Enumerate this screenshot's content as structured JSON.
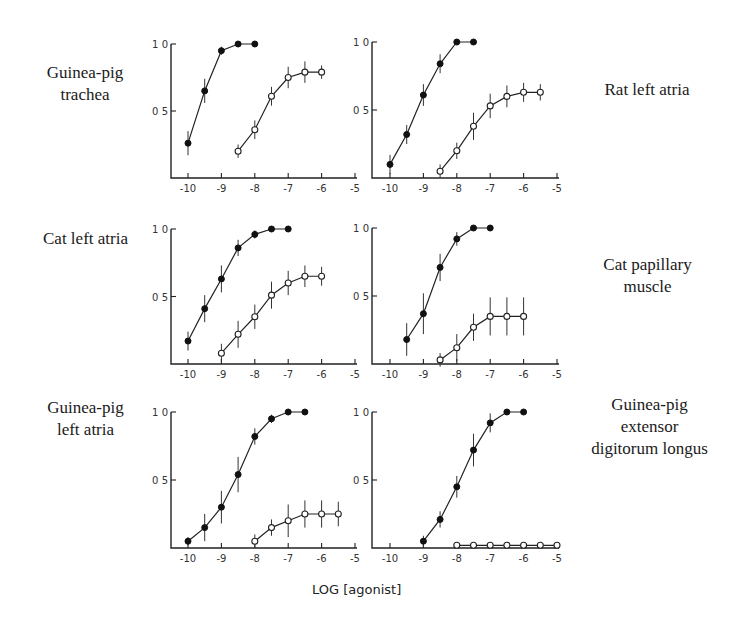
{
  "figure": {
    "xlabel": "LOG [agonist]"
  },
  "chart_data": [
    {
      "type": "line",
      "title": "Guinea-pig trachea",
      "title_lines": [
        "Guinea-pig",
        "trachea"
      ],
      "xlabel": "LOG [agonist]",
      "ylabel": "",
      "xlim": [
        -10,
        -5
      ],
      "ylim": [
        0,
        1.0
      ],
      "x_ticks": [
        "-10",
        "-9",
        "-8",
        "-7",
        "-6",
        "-5"
      ],
      "y_ticks": [
        "0 5",
        "1 0"
      ],
      "grid": false,
      "series": [
        {
          "name": "filled",
          "marker": "filled-circle",
          "x": [
            -10,
            -9.5,
            -9,
            -8.5,
            -8
          ],
          "y": [
            0.26,
            0.65,
            0.95,
            1.0,
            1.0
          ],
          "err": [
            0.09,
            0.09,
            0.03,
            0,
            0
          ]
        },
        {
          "name": "open",
          "marker": "open-circle",
          "x": [
            -8.5,
            -8,
            -7.5,
            -7,
            -6.5,
            -6
          ],
          "y": [
            0.2,
            0.36,
            0.61,
            0.75,
            0.79,
            0.79
          ],
          "err": [
            0.05,
            0.07,
            0.07,
            0.08,
            0.08,
            0.05
          ]
        }
      ]
    },
    {
      "type": "line",
      "title": "Rat left atria",
      "title_lines": [
        "Rat left atria"
      ],
      "xlabel": "LOG [agonist]",
      "ylabel": "",
      "xlim": [
        -10,
        -5
      ],
      "ylim": [
        0,
        1.0
      ],
      "x_ticks": [
        "-10",
        "-9",
        "-8",
        "-7",
        "-6",
        "-5"
      ],
      "y_ticks": [
        "0 5",
        "1 0"
      ],
      "grid": false,
      "series": [
        {
          "name": "filled",
          "marker": "filled-circle",
          "x": [
            -10,
            -9.5,
            -9,
            -8.5,
            -8,
            -7.5
          ],
          "y": [
            0.1,
            0.32,
            0.61,
            0.84,
            1.0,
            1.0
          ],
          "err": [
            0.07,
            0.07,
            0.08,
            0.07,
            0,
            0
          ]
        },
        {
          "name": "open",
          "marker": "open-circle",
          "x": [
            -8.5,
            -8,
            -7.5,
            -7,
            -6.5,
            -6,
            -5.5
          ],
          "y": [
            0.05,
            0.2,
            0.38,
            0.53,
            0.6,
            0.63,
            0.63
          ],
          "err": [
            0.05,
            0.06,
            0.1,
            0.09,
            0.08,
            0.07,
            0.06
          ]
        }
      ]
    },
    {
      "type": "line",
      "title": "Cat left atria",
      "title_lines": [
        "Cat left atria"
      ],
      "xlabel": "LOG [agonist]",
      "ylabel": "",
      "xlim": [
        -10,
        -5
      ],
      "ylim": [
        0,
        1.0
      ],
      "x_ticks": [
        "-10",
        "-9",
        "-8",
        "-7",
        "-6",
        "-5"
      ],
      "y_ticks": [
        "0 5",
        "1 0"
      ],
      "grid": false,
      "series": [
        {
          "name": "filled",
          "marker": "filled-circle",
          "x": [
            -10,
            -9.5,
            -9,
            -8.5,
            -8,
            -7.5,
            -7
          ],
          "y": [
            0.17,
            0.41,
            0.63,
            0.86,
            0.96,
            1.0,
            1.0
          ],
          "err": [
            0.07,
            0.1,
            0.1,
            0.06,
            0.03,
            0,
            0
          ]
        },
        {
          "name": "open",
          "marker": "open-circle",
          "x": [
            -9,
            -8.5,
            -8,
            -7.5,
            -7,
            -6.5,
            -6
          ],
          "y": [
            0.08,
            0.22,
            0.35,
            0.51,
            0.6,
            0.65,
            0.65
          ],
          "err": [
            0.07,
            0.1,
            0.09,
            0.1,
            0.09,
            0.08,
            0.07
          ]
        }
      ]
    },
    {
      "type": "line",
      "title": "Cat papillary muscle",
      "title_lines": [
        "Cat papillary",
        "muscle"
      ],
      "xlabel": "LOG [agonist]",
      "ylabel": "",
      "xlim": [
        -10,
        -5
      ],
      "ylim": [
        0,
        1.0
      ],
      "x_ticks": [
        "-10",
        "-9",
        "-8",
        "-7",
        "-6",
        "-5"
      ],
      "y_ticks": [
        "0 5",
        "1 0"
      ],
      "grid": false,
      "series": [
        {
          "name": "filled",
          "marker": "filled-circle",
          "x": [
            -9.5,
            -9,
            -8.5,
            -8,
            -7.5,
            -7
          ],
          "y": [
            0.18,
            0.37,
            0.71,
            0.92,
            1.0,
            1.0
          ],
          "err": [
            0.12,
            0.15,
            0.1,
            0.05,
            0,
            0
          ]
        },
        {
          "name": "open",
          "marker": "open-circle",
          "x": [
            -8.5,
            -8,
            -7.5,
            -7,
            -6.5,
            -6
          ],
          "y": [
            0.03,
            0.12,
            0.27,
            0.35,
            0.35,
            0.35
          ],
          "err": [
            0.05,
            0.1,
            0.1,
            0.14,
            0.14,
            0.14
          ]
        }
      ]
    },
    {
      "type": "line",
      "title": "Guinea-pig left atria",
      "title_lines": [
        "Guinea-pig",
        "left atria"
      ],
      "xlabel": "LOG [agonist]",
      "ylabel": "",
      "xlim": [
        -10,
        -5
      ],
      "ylim": [
        0,
        1.0
      ],
      "x_ticks": [
        "-10",
        "-9",
        "-8",
        "-7",
        "-6",
        "-5"
      ],
      "y_ticks": [
        "0 5",
        "1 0"
      ],
      "grid": false,
      "series": [
        {
          "name": "filled",
          "marker": "filled-circle",
          "x": [
            -10,
            -9.5,
            -9,
            -8.5,
            -8,
            -7.5,
            -7,
            -6.5
          ],
          "y": [
            0.05,
            0.15,
            0.3,
            0.54,
            0.82,
            0.95,
            1.0,
            1.0
          ],
          "err": [
            0.03,
            0.1,
            0.12,
            0.13,
            0.06,
            0.03,
            0,
            0
          ]
        },
        {
          "name": "open",
          "marker": "open-circle",
          "x": [
            -8,
            -7.5,
            -7,
            -6.5,
            -6,
            -5.5
          ],
          "y": [
            0.05,
            0.15,
            0.2,
            0.25,
            0.25,
            0.25
          ],
          "err": [
            0.05,
            0.06,
            0.12,
            0.1,
            0.1,
            0.09
          ]
        }
      ]
    },
    {
      "type": "line",
      "title": "Guinea-pig extensor digitorum longus",
      "title_lines": [
        "Guinea-pig",
        "extensor",
        "digitorum longus"
      ],
      "xlabel": "LOG [agonist]",
      "ylabel": "",
      "xlim": [
        -10,
        -5
      ],
      "ylim": [
        0,
        1.0
      ],
      "x_ticks": [
        "-10",
        "-9",
        "-8",
        "-7",
        "-6",
        "-5"
      ],
      "y_ticks": [
        "0 5",
        "1 0"
      ],
      "grid": false,
      "series": [
        {
          "name": "filled",
          "marker": "filled-circle",
          "x": [
            -9,
            -8.5,
            -8,
            -7.5,
            -7,
            -6.5,
            -6
          ],
          "y": [
            0.05,
            0.21,
            0.45,
            0.72,
            0.92,
            1.0,
            1.0
          ],
          "err": [
            0.04,
            0.06,
            0.08,
            0.12,
            0.07,
            0,
            0
          ]
        },
        {
          "name": "open",
          "marker": "open-circle",
          "x": [
            -8,
            -7.5,
            -7,
            -6.5,
            -6,
            -5.5,
            -5
          ],
          "y": [
            0.02,
            0.02,
            0.02,
            0.02,
            0.02,
            0.02,
            0.02
          ],
          "err": [
            0,
            0,
            0,
            0,
            0,
            0,
            0
          ]
        }
      ]
    }
  ],
  "layout": {
    "panels": [
      {
        "ox": 171,
        "oy": 178,
        "top": 44,
        "x10": 188,
        "x5": 355,
        "label": {
          "left": 20,
          "top": 62,
          "width": 130
        }
      },
      {
        "ox": 372,
        "oy": 178,
        "top": 42,
        "x10": 390,
        "x5": 557,
        "label": {
          "left": 582,
          "top": 79,
          "width": 130
        }
      },
      {
        "ox": 171,
        "oy": 364,
        "top": 229,
        "x10": 188,
        "x5": 355,
        "label": {
          "left": 18,
          "top": 228,
          "width": 135
        }
      },
      {
        "ox": 372,
        "oy": 364,
        "top": 228,
        "x10": 390,
        "x5": 557,
        "label": {
          "left": 580,
          "top": 254,
          "width": 135
        }
      },
      {
        "ox": 171,
        "oy": 548,
        "top": 412,
        "x10": 188,
        "x5": 355,
        "label": {
          "left": 18,
          "top": 397,
          "width": 135
        }
      },
      {
        "ox": 372,
        "oy": 548,
        "top": 412,
        "x10": 390,
        "x5": 557,
        "label": {
          "left": 572,
          "top": 394,
          "width": 155
        }
      }
    ]
  }
}
